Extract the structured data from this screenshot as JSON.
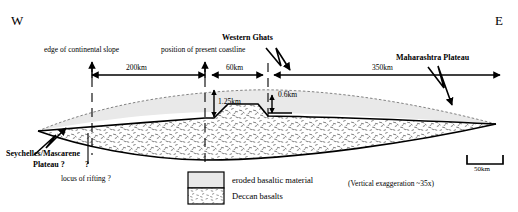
{
  "figure": {
    "type": "geological-cross-section",
    "orientation": {
      "west_label": "W",
      "east_label": "E"
    },
    "annotations": {
      "edge_of_slope": "edge of continental slope",
      "present_coastline": "position of present coastline",
      "western_ghats": "Western Ghats",
      "maharashtra_plateau": "Maharashtra Plateau",
      "seychelles": "Seychelles/Mascarene",
      "seychelles_line2": "Plateau ?",
      "question_mark": "?",
      "locus_of_rifting": "locus of rifting ?"
    },
    "distances": {
      "slope_to_coast": "200km",
      "coast_to_ghats": "60km",
      "ghats_to_east": "350km"
    },
    "thicknesses": {
      "coastal_scarp": "1.25km",
      "ghats_step": "0.6km"
    },
    "legend": {
      "items": [
        {
          "key": "eroded",
          "label": "eroded basaltic material",
          "fill": "#e8e8e8"
        },
        {
          "key": "deccan",
          "label": "Deccan basalts",
          "fill": "#ffffff"
        }
      ]
    },
    "scale_bar": {
      "label": "50km"
    },
    "vertical_exaggeration": "(Vertical exaggeration ~35x)",
    "colors": {
      "ink": "#000000",
      "eroded_fill": "#e9e9e9",
      "basalt_fill": "#ffffff",
      "dashed": "#555555"
    }
  }
}
